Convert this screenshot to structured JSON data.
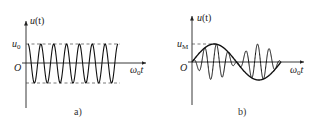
{
  "figure": {
    "panels": [
      {
        "id": "a",
        "caption": "a)",
        "y_axis_label": "u(t)",
        "x_axis_label": "ω₀t",
        "origin_label": "O",
        "amplitude_label": "u₀",
        "description": "Constant-amplitude sinusoidal carrier with dashed amplitude bounds at +u₀ and -u₀"
      },
      {
        "id": "b",
        "caption": "b)",
        "y_axis_label": "u(t)",
        "x_axis_label": "ω₀t",
        "origin_label": "O",
        "amplitude_label": "u_M",
        "description": "High-frequency oscillation whose envelope follows one period of a low-frequency sine wave with peak u_M"
      }
    ]
  },
  "labels": {
    "a": {
      "u": "u",
      "t": "(t)",
      "u0_main": "u",
      "u0_sub": "0",
      "origin": "O",
      "omega": "ω",
      "omega_sub": "0",
      "t_axis": "t",
      "caption": "a)"
    },
    "b": {
      "u": "u",
      "t": "(t)",
      "uM_main": "u",
      "uM_sub": "M",
      "origin": "O",
      "omega": "ω",
      "omega_sub": "0",
      "t_axis": "t",
      "caption": "b)"
    }
  }
}
